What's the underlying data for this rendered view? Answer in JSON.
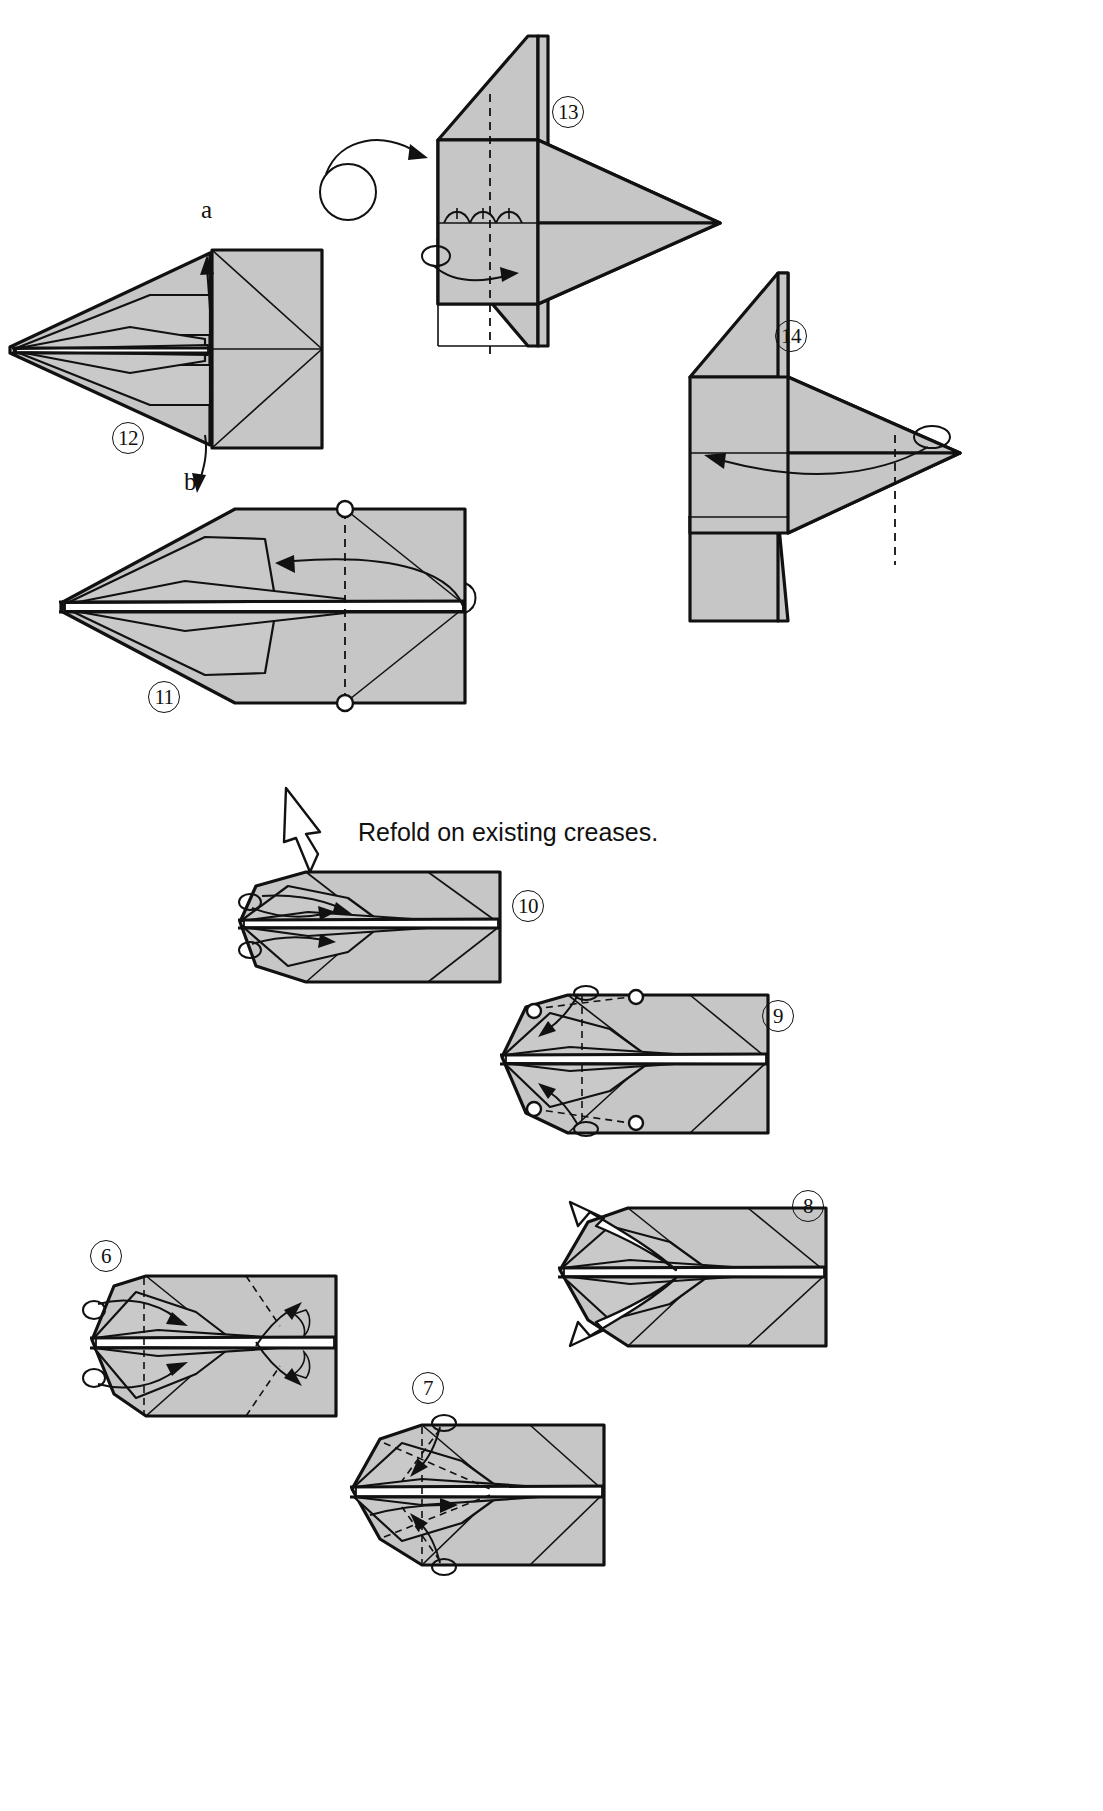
{
  "page": {
    "kind": "origami-instruction-diagram",
    "width": 1103,
    "height": 1811,
    "background_color": "#ffffff",
    "paper_fill_color": "#c9c9c9",
    "line_color": "#111111"
  },
  "notes": [
    {
      "id": "refold-note",
      "text": "Refold on existing creases."
    }
  ],
  "labels": [
    {
      "id": "label-a",
      "text": "a"
    },
    {
      "id": "label-b",
      "text": "b"
    }
  ],
  "steps": [
    {
      "number": "6",
      "badge": "⑥",
      "label": "6"
    },
    {
      "number": "7",
      "badge": "⑦",
      "label": "7"
    },
    {
      "number": "8",
      "badge": "⑧",
      "label": "8"
    },
    {
      "number": "9",
      "badge": "⑨",
      "label": "9"
    },
    {
      "number": "10",
      "badge": "⑩",
      "label": "10"
    },
    {
      "number": "11",
      "badge": "⑪",
      "label": "11"
    },
    {
      "number": "12",
      "badge": "⑫",
      "label": "12"
    },
    {
      "number": "13",
      "badge": "⑬",
      "label": "13"
    },
    {
      "number": "14",
      "badge": "⑭",
      "label": "14"
    }
  ],
  "step_order_on_page": [
    "12",
    "13",
    "14",
    "11",
    "10",
    "9",
    "6",
    "8",
    "7"
  ],
  "icons": {
    "turn_over_icon": "turn-over-arrow",
    "valley_fold_icon": "dashed-line",
    "fold_arrow_icon": "solid-arrow",
    "unfold_arrow_icon": "hollow-arrow",
    "repeat_icon": "loop-arrow",
    "reference_point_icon": "circle-marker"
  },
  "figures": [
    {
      "id": "fig-12",
      "step": "12",
      "desc": "pointed nose form with square rear panel, arrows a and b pulling up and down"
    },
    {
      "id": "fig-13",
      "step": "13",
      "desc": "side view, vertical wing panel with turn-over arrow and rolling fold arrow"
    },
    {
      "id": "fig-14",
      "step": "14",
      "desc": "mirrored side view with rolling fold arrow pointing left"
    },
    {
      "id": "fig-11",
      "step": "11",
      "desc": "flat plan view with centre dashed valley crease and two circle markers"
    },
    {
      "id": "fig-10",
      "step": "10",
      "desc": "narrow nose form with small fold arrows at the tip"
    },
    {
      "id": "fig-9",
      "step": "9",
      "desc": "plan view with dashed folds at top and bottom corners and circle markers"
    },
    {
      "id": "fig-6",
      "step": "6",
      "desc": "plan view with dashed creases and pleat arrows"
    },
    {
      "id": "fig-7",
      "step": "7",
      "desc": "plan view with crossing dashed creases and inward arrows"
    },
    {
      "id": "fig-8",
      "step": "8",
      "desc": "plan view with two hollow unfold arrows at the nose"
    }
  ]
}
